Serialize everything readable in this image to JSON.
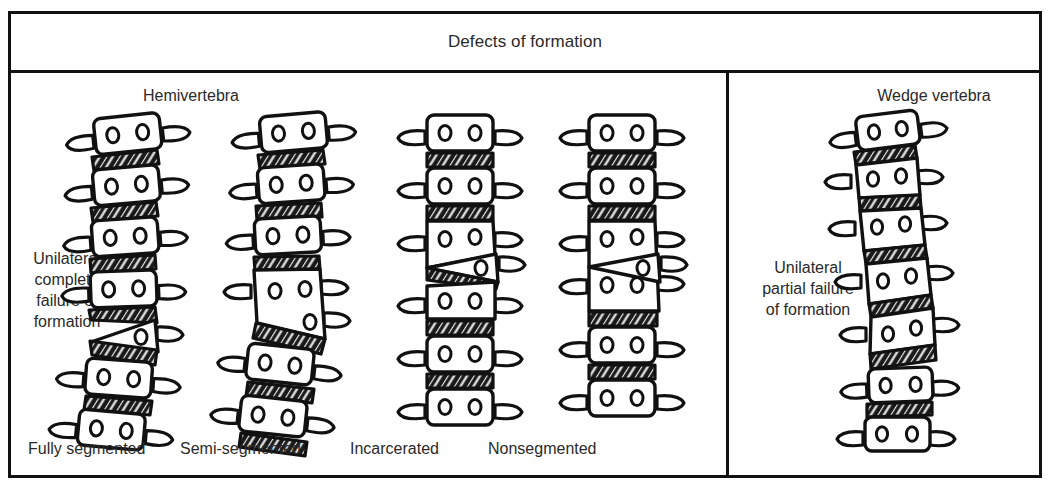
{
  "figure": {
    "title": "Defects of formation",
    "background_color": "#ffffff",
    "ink_color": "#111111"
  },
  "panels": {
    "left": {
      "heading": "Hemivertebra",
      "side_label": "Unilateral\ncomplete\nfailure of\nformation",
      "captions": [
        "Fully segmented",
        "Semi-segmented",
        "Incarcerated",
        "Nonsegmented"
      ]
    },
    "right": {
      "heading": "Wedge vertebra",
      "side_label": "Unilateral\npartial failure\nof formation"
    }
  },
  "diagram_data": {
    "type": "medical-illustration",
    "subject": "congenital vertebral anomalies of the spine",
    "element_legend": {
      "vertebral_body": "rounded rectangle outline",
      "pedicle_marks": "two small ovals inside each body",
      "transverse_process": "small stub lobe on each lateral side",
      "intervertebral_disc": "dark cross-hatched band between bodies",
      "hemivertebra": "triangular wedge-shaped partial vertebra",
      "wedge_vertebra": "trapezoid body taller on one side"
    },
    "spines": [
      {
        "name": "Fully segmented hemivertebra",
        "caption": "Fully segmented",
        "vertebra_count": 7,
        "hemivertebra": true,
        "hemivertebra_side": "right",
        "discs_above_and_below_hemivertebra": true,
        "curvature": "lateral curve"
      },
      {
        "name": "Semi-segmented hemivertebra",
        "caption": "Semi-segmented",
        "vertebra_count": 7,
        "hemivertebra": true,
        "hemivertebra_side": "right",
        "discs_above_and_below_hemivertebra": false,
        "curvature": "lateral curve"
      },
      {
        "name": "Incarcerated hemivertebra",
        "caption": "Incarcerated",
        "vertebra_count": 7,
        "hemivertebra": true,
        "hemivertebra_side": "right",
        "discs_above_and_below_hemivertebra": true,
        "curvature": "straight"
      },
      {
        "name": "Nonsegmented hemivertebra",
        "caption": "Nonsegmented",
        "vertebra_count": 7,
        "hemivertebra": true,
        "hemivertebra_side": "right",
        "discs_above_and_below_hemivertebra": false,
        "curvature": "straight"
      },
      {
        "name": "Wedge vertebra",
        "caption": "",
        "vertebra_count": 8,
        "hemivertebra": false,
        "wedge_vertebrae": 4,
        "curvature": "gradual lateral curve"
      }
    ]
  }
}
